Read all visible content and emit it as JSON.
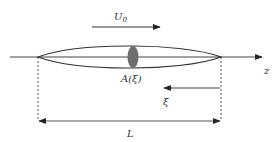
{
  "diagram": {
    "type": "slender-body-schematic",
    "labels": {
      "velocity": "U",
      "velocity_subscript": "0",
      "cross_section": "A(ξ)",
      "axis": "z",
      "coordinate": "ξ",
      "length": "L"
    },
    "colors": {
      "line": "#333333",
      "cross_section_fill": "#6e6e6e",
      "background": "#ffffff"
    },
    "elements": [
      {
        "id": "z-axis",
        "kind": "arrow",
        "direction": "right"
      },
      {
        "id": "body",
        "kind": "slender-ellipse"
      },
      {
        "id": "cross-section",
        "kind": "filled-ellipse"
      },
      {
        "id": "velocity-arrow",
        "kind": "arrow",
        "direction": "right",
        "label": "U0"
      },
      {
        "id": "xi-arrow",
        "kind": "arrow",
        "direction": "left",
        "label": "ξ"
      },
      {
        "id": "length-dimension",
        "kind": "double-arrow",
        "label": "L"
      }
    ]
  }
}
